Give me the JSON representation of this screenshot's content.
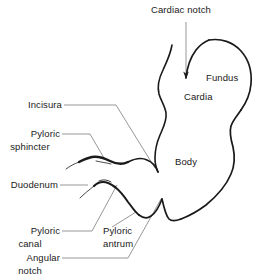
{
  "diagram": {
    "background_color": "#ffffff",
    "outline_color": "#1a1a1a",
    "leader_line_color": "#555555",
    "labels": {
      "cardiac_notch": "Cardiac notch",
      "fundus": "Fundus",
      "cardia": "Cardia",
      "body": "Body",
      "incisura": "Incisura",
      "pyloric_sphincter_line1": "Pyloric",
      "pyloric_sphincter_line2": "sphincter",
      "duodenum": "Duodenum",
      "pyloric_canal_line1": "Pyloric",
      "pyloric_canal_line2": "canal",
      "pyloric_antrum_line1": "Pyloric",
      "pyloric_antrum_line2": "antrum",
      "angular_notch_line1": "Angular",
      "angular_notch_line2": "notch"
    }
  }
}
